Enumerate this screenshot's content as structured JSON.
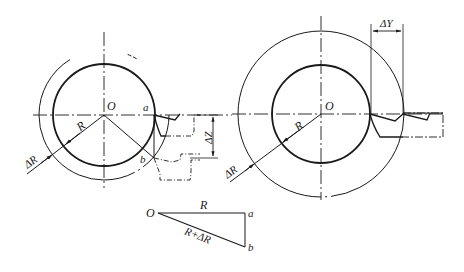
{
  "diagram": {
    "title": "",
    "colors": {
      "ink": "#1a1a1a",
      "background": "#ffffff"
    },
    "left_view": {
      "center_label": "O",
      "point_a_label": "a",
      "point_b_label": "b",
      "radius_label": "R",
      "delta_radius_label": "ΔR",
      "dimension_label": "ΔZ",
      "center": [
        104,
        115
      ],
      "inner_radius": 51,
      "outer_radius": 65
    },
    "right_view": {
      "center_label": "O",
      "radius_label": "R",
      "delta_radius_label": "ΔR",
      "dimension_label": "ΔY",
      "center": [
        321,
        114
      ],
      "inner_radius": 49,
      "outer_radius": 83
    },
    "triangle": {
      "vertex_o_label": "O",
      "vertex_a_label": "a",
      "vertex_b_label": "b",
      "side_oa_label": "R",
      "side_ob_label": "R+ΔR"
    }
  }
}
